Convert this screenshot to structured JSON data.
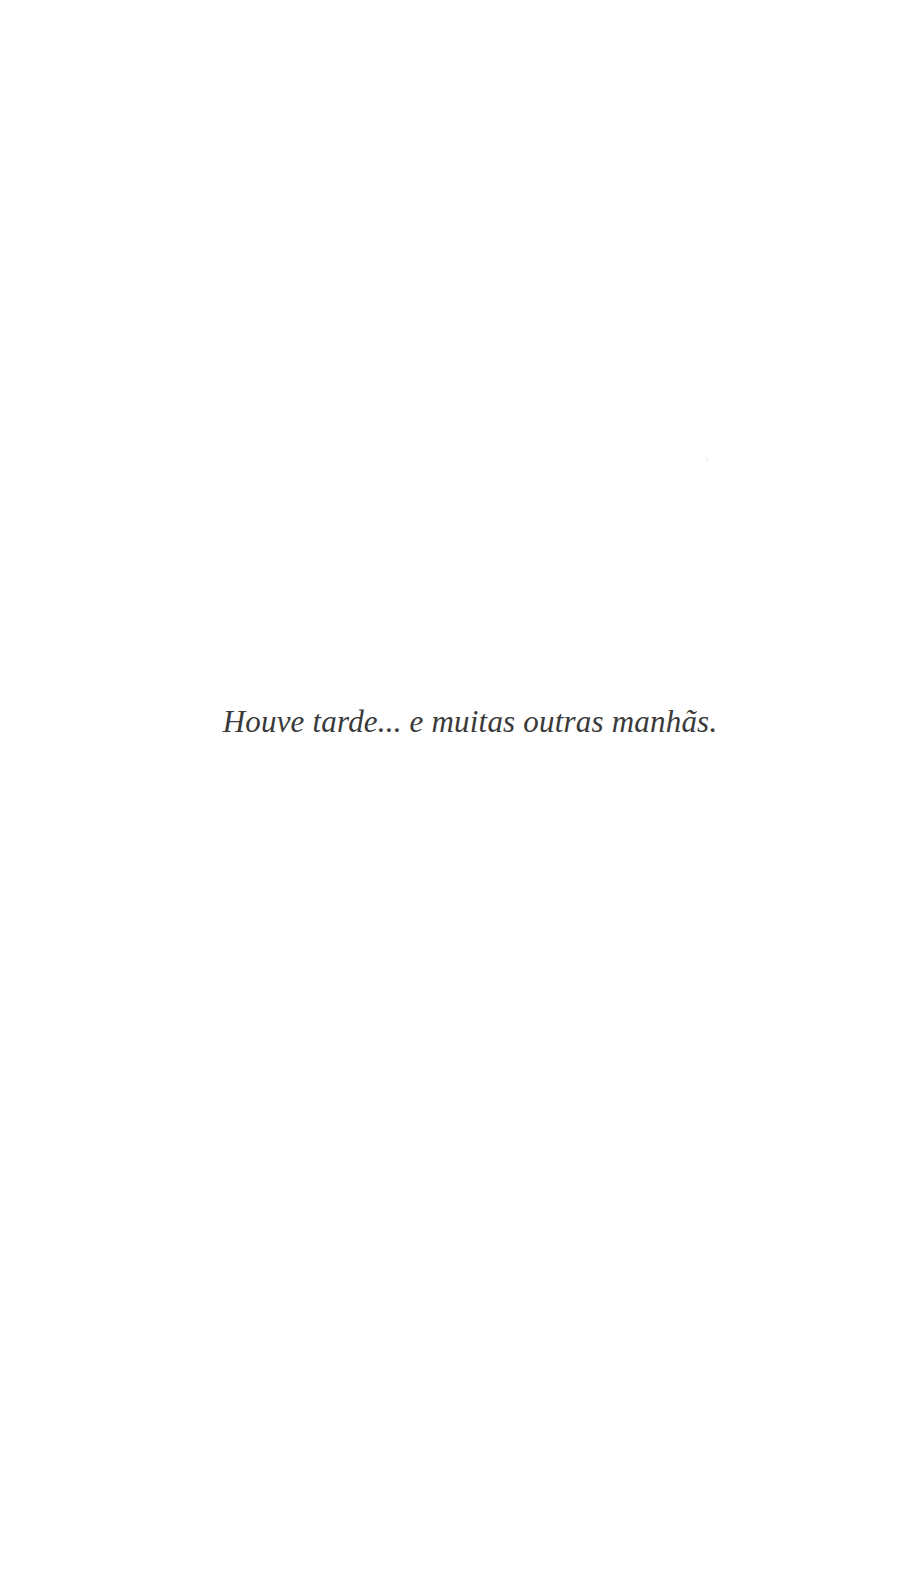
{
  "page": {
    "background": "#ffffff",
    "text_color": "#3a3a3a",
    "epigraph": "Houve tarde... e muitas outras manhãs."
  }
}
